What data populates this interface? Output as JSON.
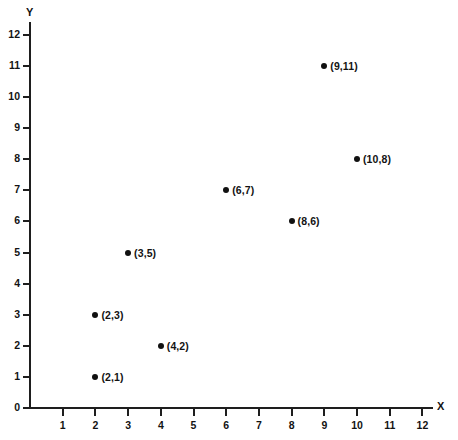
{
  "chart_data": {
    "type": "scatter",
    "title": "",
    "xlabel": "X",
    "ylabel": "Y",
    "xlim": [
      0,
      12
    ],
    "ylim": [
      0,
      12
    ],
    "grid": false,
    "legend": "none",
    "marker_color": "#111111",
    "axis_color": "#1e1e1e",
    "background": "#ffffff",
    "x_ticks": [
      1,
      2,
      3,
      4,
      5,
      6,
      7,
      8,
      9,
      10,
      11,
      12
    ],
    "y_ticks": [
      0,
      1,
      2,
      3,
      4,
      5,
      6,
      7,
      8,
      9,
      10,
      11,
      12
    ],
    "points": [
      {
        "x": 2,
        "y": 1,
        "label": "(2,1)"
      },
      {
        "x": 2,
        "y": 3,
        "label": "(2,3)"
      },
      {
        "x": 3,
        "y": 5,
        "label": "(3,5)"
      },
      {
        "x": 4,
        "y": 2,
        "label": "(4,2)"
      },
      {
        "x": 6,
        "y": 7,
        "label": "(6,7)"
      },
      {
        "x": 8,
        "y": 6,
        "label": "(8,6)"
      },
      {
        "x": 9,
        "y": 11,
        "label": "(9,11)"
      },
      {
        "x": 10,
        "y": 8,
        "label": "(10,8)"
      }
    ]
  }
}
